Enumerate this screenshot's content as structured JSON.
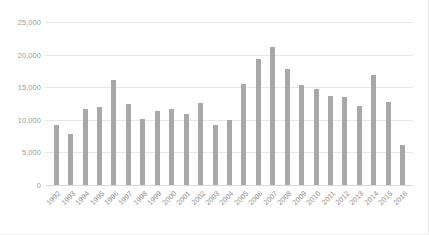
{
  "chart_data": {
    "type": "bar",
    "title": "",
    "subtitle": "",
    "xlabel": "",
    "ylabel": "",
    "grid": true,
    "legend": false,
    "ylim": [
      0,
      25000
    ],
    "yticks": [
      "0",
      "5,000",
      "10,000",
      "15,000",
      "20,000",
      "25,000"
    ],
    "ytick_values": [
      0,
      5000,
      10000,
      15000,
      20000,
      25000
    ],
    "bar_color": "#a8a8a8",
    "gridline_color": "#e6e6e6",
    "categories": [
      "1992",
      "1993",
      "1994",
      "1995",
      "1996",
      "1997",
      "1998",
      "1999",
      "2000",
      "2001",
      "2002",
      "2003",
      "2004",
      "2005",
      "2006",
      "2007",
      "2008",
      "2009",
      "2010",
      "2011",
      "2012",
      "2013",
      "2014",
      "2015",
      "2016"
    ],
    "values": [
      9200,
      7900,
      11600,
      11900,
      16100,
      12400,
      10200,
      11300,
      11700,
      10900,
      12600,
      9200,
      9900,
      15500,
      19400,
      21200,
      17800,
      15300,
      14800,
      13700,
      13500,
      12100,
      16800,
      12700,
      6200
    ]
  }
}
